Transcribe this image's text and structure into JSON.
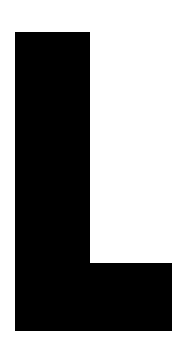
{
  "image": {
    "width": 187,
    "height": 357,
    "background_color": "#ffffff",
    "content_type": "single-letter-glyph"
  },
  "glyph": {
    "character": "L",
    "name": "letter-l",
    "color": "#000000",
    "description": "Uppercase letter L rendered as a solid black sans-serif block glyph",
    "geometry": {
      "stem": {
        "x": 15,
        "y": 32,
        "width": 75,
        "height": 299
      },
      "foot": {
        "x": 15,
        "y": 263,
        "width": 157,
        "height": 68
      },
      "bounds": {
        "left": 15,
        "top": 32,
        "right": 172,
        "bottom": 331
      }
    }
  }
}
